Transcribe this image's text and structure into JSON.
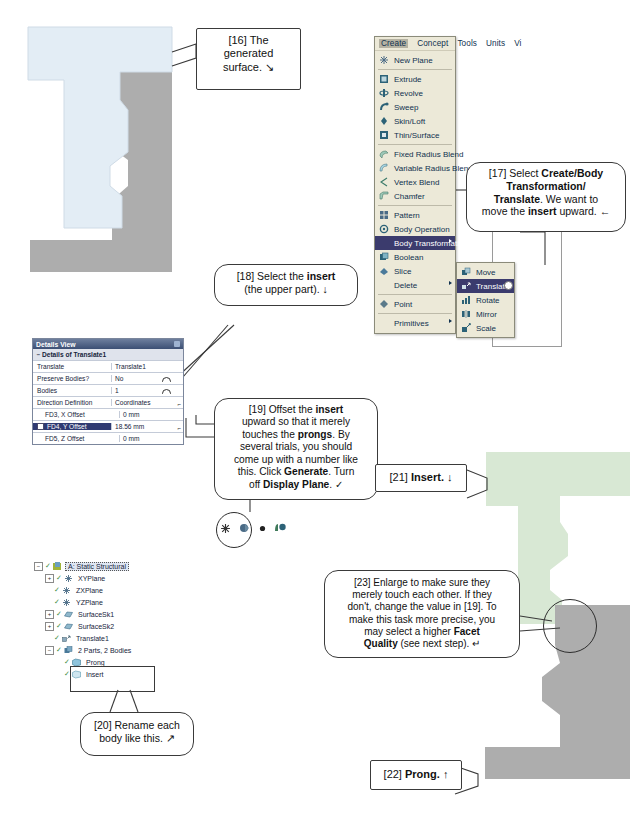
{
  "document": {
    "title": "ANSYS DesignModeler tutorial page - Body Transformation / Translate"
  },
  "viewport": {
    "surface_color": "#e3edf5",
    "prong_color": "#adadad",
    "insert_color": "#d8e8d4"
  },
  "menu": {
    "menubar": [
      {
        "label": "Create",
        "active": true
      },
      {
        "label": "Concept",
        "active": false
      },
      {
        "label": "Tools",
        "active": false
      },
      {
        "label": "Units",
        "active": false
      },
      {
        "label": "Vi",
        "active": false
      }
    ],
    "items": [
      {
        "label": "New Plane",
        "icon": "plane-icon",
        "submenu": false,
        "selected": false
      },
      {
        "separator": true
      },
      {
        "label": "Extrude",
        "icon": "extrude-icon",
        "submenu": false,
        "selected": false
      },
      {
        "label": "Revolve",
        "icon": "revolve-icon",
        "submenu": false,
        "selected": false
      },
      {
        "label": "Sweep",
        "icon": "sweep-icon",
        "submenu": false,
        "selected": false
      },
      {
        "label": "Skin/Loft",
        "icon": "skinloft-icon",
        "submenu": false,
        "selected": false
      },
      {
        "label": "Thin/Surface",
        "icon": "thinsurface-icon",
        "submenu": false,
        "selected": false
      },
      {
        "separator": true
      },
      {
        "label": "Fixed Radius Blend",
        "icon": "blend-icon",
        "submenu": false,
        "selected": false
      },
      {
        "label": "Variable Radius Blend",
        "icon": "var-blend-icon",
        "submenu": false,
        "selected": false
      },
      {
        "label": "Vertex Blend",
        "icon": "vertex-blend-icon",
        "submenu": false,
        "selected": false
      },
      {
        "label": "Chamfer",
        "icon": "chamfer-icon",
        "submenu": false,
        "selected": false
      },
      {
        "separator": true
      },
      {
        "label": "Pattern",
        "icon": "pattern-icon",
        "submenu": false,
        "selected": false
      },
      {
        "label": "Body Operation",
        "icon": "body-operation-icon",
        "submenu": false,
        "selected": false
      },
      {
        "label": "Body Transformation",
        "icon": "body-transformation-icon",
        "submenu": true,
        "selected": true
      },
      {
        "label": "Boolean",
        "icon": "boolean-icon",
        "submenu": false,
        "selected": false
      },
      {
        "label": "Slice",
        "icon": "slice-icon",
        "submenu": false,
        "selected": false
      },
      {
        "label": "Delete",
        "icon": "",
        "submenu": true,
        "selected": false
      },
      {
        "separator": true
      },
      {
        "label": "Point",
        "icon": "point-icon",
        "submenu": false,
        "selected": false
      },
      {
        "separator": true
      },
      {
        "label": "Primitives",
        "icon": "",
        "submenu": true,
        "selected": false
      }
    ],
    "submenu": {
      "items": [
        {
          "label": "Move",
          "icon": "move-icon",
          "selected": false
        },
        {
          "label": "Translate",
          "icon": "translate-icon",
          "selected": true
        },
        {
          "label": "Rotate",
          "icon": "rotate-icon",
          "selected": false
        },
        {
          "label": "Mirror",
          "icon": "mirror-icon",
          "selected": false
        },
        {
          "label": "Scale",
          "icon": "scale-icon",
          "selected": false
        }
      ]
    }
  },
  "details_view": {
    "title": "Details View",
    "section": "Details of Translate1",
    "rows": [
      {
        "name": "Translate",
        "value": "Translate1",
        "indent": false,
        "highlight": false,
        "widget": ""
      },
      {
        "name": "Preserve Bodies?",
        "value": "No",
        "indent": false,
        "highlight": false,
        "widget": "circle"
      },
      {
        "name": "Bodies",
        "value": "1",
        "indent": false,
        "highlight": false,
        "widget": "circle"
      },
      {
        "name": "Direction Definition",
        "value": "Coordinates",
        "indent": false,
        "highlight": false,
        "widget": "ell"
      },
      {
        "name": "FD3, X Offset",
        "value": "0 mm",
        "indent": true,
        "highlight": false,
        "widget": ""
      },
      {
        "name": "FD4, Y Offset",
        "value": "18.56 mm",
        "indent": true,
        "highlight": true,
        "widget": "ell"
      },
      {
        "name": "FD5, Z Offset",
        "value": "0 mm",
        "indent": true,
        "highlight": false,
        "widget": ""
      }
    ]
  },
  "tree": {
    "nodes": [
      {
        "label": "A: Static Structural",
        "depth": 0,
        "expander": "-",
        "check": true,
        "icon": "static-structural-icon",
        "selected": true
      },
      {
        "label": "XYPlane",
        "depth": 1,
        "expander": "+",
        "check": true,
        "icon": "plane-icon",
        "selected": false
      },
      {
        "label": "ZXPlane",
        "depth": 1,
        "expander": "",
        "check": true,
        "icon": "plane-icon",
        "selected": false
      },
      {
        "label": "YZPlane",
        "depth": 1,
        "expander": "",
        "check": true,
        "icon": "plane-icon",
        "selected": false
      },
      {
        "label": "SurfaceSk1",
        "depth": 1,
        "expander": "+",
        "check": true,
        "icon": "surface-icon",
        "selected": false
      },
      {
        "label": "SurfaceSk2",
        "depth": 1,
        "expander": "+",
        "check": true,
        "icon": "surface-icon",
        "selected": false
      },
      {
        "label": "Translate1",
        "depth": 1,
        "expander": "",
        "check": true,
        "icon": "translate-icon",
        "selected": false
      },
      {
        "label": "2 Parts, 2 Bodies",
        "depth": 1,
        "expander": "-",
        "check": true,
        "icon": "parts-icon",
        "selected": false
      },
      {
        "label": "Prong",
        "depth": 2,
        "expander": "",
        "check": true,
        "icon": "body-icon",
        "selected": false
      },
      {
        "label": "Insert",
        "depth": 2,
        "expander": "",
        "check": true,
        "icon": "body-icon",
        "selected": false
      }
    ]
  },
  "toolbar": {
    "icons": [
      "new-plane-icon",
      "generate-icon",
      "dot-icon",
      "display-plane-icon"
    ]
  },
  "callouts": {
    "c16": {
      "tag": "[16]",
      "text": "The generated surface.",
      "marker": "↘"
    },
    "c17": {
      "tag": "[17]",
      "line1_pre": "Select ",
      "line1_b": "Create/Body",
      "line2_b": "Transformation/",
      "line3_b": "Translate",
      "line3_post": ". We want to",
      "line4_pre": "move the ",
      "line4_b": "insert",
      "line4_post": " upward.",
      "marker": "←"
    },
    "c18": {
      "tag": "[18]",
      "line1_pre": "Select the ",
      "line1_b": "insert",
      "line2": "(the upper part).",
      "marker": "↓"
    },
    "c19": {
      "tag": "[19]",
      "line1_pre": "Offset the ",
      "line1_b": "insert",
      "line2": "upward so that it merely",
      "line3_pre": "touches the ",
      "line3_b": "prongs",
      "line3_post": ". By",
      "line4": "several trials, you should",
      "line5": "come up with a number like",
      "line6_pre": "this. Click ",
      "line6_b": "Generate",
      "line6_post": ". Turn",
      "line7_pre": "off ",
      "line7_b": "Display Plane",
      "line7_post": ".",
      "marker": "✓"
    },
    "c20": {
      "tag": "[20]",
      "line1": "Rename each",
      "line2": "body like this.",
      "marker": "↗"
    },
    "c21": {
      "tag": "[21]",
      "text": "Insert.",
      "marker": "↓"
    },
    "c22": {
      "tag": "[22]",
      "text": "Prong.",
      "marker": "↑"
    },
    "c23": {
      "tag": "[23]",
      "line1": "Enlarge to make sure they",
      "line2": "merely touch each other.  If they",
      "line3": "don't, change the value in [19]. To",
      "line4": "make this task more precise, you",
      "line5_pre": "may select a higher ",
      "line5_b": "Facet",
      "line6_b": "Quality",
      "line6_post": " (see next step).",
      "marker": "↵"
    }
  }
}
